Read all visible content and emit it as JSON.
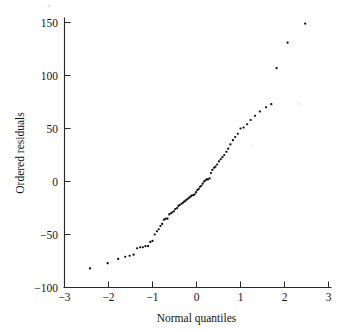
{
  "figure": {
    "title": "",
    "background_color": "#ffffff",
    "marker_color": "#111111",
    "axis_color": "#2a2a2a"
  },
  "axes": {
    "x_title": "Normal quantiles",
    "y_title": "Ordered residuals",
    "x_tick_labels": [
      "−3",
      "−2",
      "−1",
      "0",
      "1",
      "2",
      "3"
    ],
    "y_tick_labels": [
      "150",
      "100",
      "50",
      "0",
      "−50",
      "−100"
    ]
  },
  "chart_data": {
    "type": "scatter",
    "title": "",
    "subtitle": "",
    "xlabel": "Normal quantiles",
    "ylabel": "Ordered residuals",
    "xlim": [
      -3,
      3
    ],
    "ylim": [
      -100,
      160
    ],
    "xticks": [
      -3,
      -2,
      -1,
      0,
      1,
      2,
      3
    ],
    "yticks": [
      -100,
      -50,
      0,
      50,
      100,
      150
    ],
    "grid": false,
    "legend": null,
    "legend_position": "none",
    "marker": "square",
    "marker_size": 2.1,
    "series": [
      {
        "name": "ordered residuals vs normal quantiles",
        "x": [
          -2.42,
          -2.02,
          -1.78,
          -1.62,
          -1.52,
          -1.43,
          -1.35,
          -1.28,
          -1.22,
          -1.16,
          -1.1,
          -1.05,
          -1.0,
          -0.95,
          -0.9,
          -0.86,
          -0.82,
          -0.78,
          -0.74,
          -0.7,
          -0.66,
          -0.62,
          -0.58,
          -0.55,
          -0.51,
          -0.48,
          -0.44,
          -0.41,
          -0.38,
          -0.34,
          -0.31,
          -0.28,
          -0.25,
          -0.22,
          -0.19,
          -0.16,
          -0.13,
          -0.1,
          -0.07,
          -0.04,
          -0.01,
          0.02,
          0.05,
          0.08,
          0.11,
          0.14,
          0.17,
          0.2,
          0.23,
          0.26,
          0.3,
          0.33,
          0.36,
          0.4,
          0.43,
          0.47,
          0.51,
          0.55,
          0.59,
          0.63,
          0.68,
          0.72,
          0.77,
          0.83,
          0.88,
          0.94,
          1.0,
          1.07,
          1.15,
          1.23,
          1.33,
          1.44,
          1.58,
          1.7,
          1.82,
          2.07,
          2.47
        ],
        "y": [
          -82,
          -77,
          -73,
          -71,
          -70,
          -69,
          -63,
          -62,
          -62,
          -61,
          -61,
          -57,
          -56,
          -50,
          -47,
          -45,
          -42,
          -40,
          -36,
          -35,
          -35,
          -31,
          -30,
          -29,
          -28,
          -26,
          -25,
          -23,
          -22,
          -21,
          -20,
          -19,
          -18,
          -17,
          -16,
          -15,
          -14,
          -13,
          -13,
          -12,
          -10,
          -8,
          -7,
          -5,
          -4,
          -2,
          0,
          1,
          2,
          2,
          3,
          8,
          11,
          13,
          14,
          16,
          19,
          21,
          23,
          25,
          28,
          31,
          35,
          39,
          42,
          45,
          50,
          51,
          54,
          58,
          62,
          66,
          70,
          73,
          107,
          131,
          149
        ]
      }
    ]
  }
}
